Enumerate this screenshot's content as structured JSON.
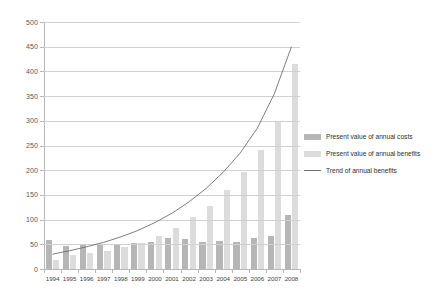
{
  "chart_data": {
    "type": "bar",
    "title": "",
    "subtitle": "",
    "xlabel": "",
    "ylabel": "",
    "ylim": [
      0,
      500
    ],
    "ytick_step": 50,
    "ytick_labels": [
      "500",
      "450",
      "400",
      "350",
      "300",
      "250",
      "200",
      "150",
      "100",
      "50",
      "0"
    ],
    "ytick_values": [
      500,
      450,
      400,
      350,
      300,
      250,
      200,
      150,
      100,
      50,
      0
    ],
    "grid": true,
    "legend_position": "right",
    "categories": [
      "1994",
      "1995",
      "1996",
      "1997",
      "1998",
      "1999",
      "2000",
      "2001",
      "2002",
      "2003",
      "2004",
      "2005",
      "2006",
      "2007",
      "2008"
    ],
    "series": [
      {
        "name": "Present value of annual costs",
        "kind": "bar",
        "color": "#b6b6b6",
        "values": [
          58,
          46,
          48,
          50,
          50,
          52,
          55,
          62,
          60,
          55,
          56,
          55,
          62,
          67,
          110
        ]
      },
      {
        "name": "Present value of annual benefits",
        "kind": "bar",
        "color": "#dcdcdc",
        "values": [
          18,
          28,
          32,
          36,
          44,
          52,
          66,
          84,
          105,
          128,
          160,
          196,
          240,
          300,
          415
        ]
      },
      {
        "name": "Trend of annual benefits",
        "kind": "line",
        "color": "#6f6f6f",
        "values": [
          30,
          37,
          45,
          54,
          65,
          78,
          94,
          113,
          136,
          163,
          196,
          235,
          285,
          355,
          450
        ]
      }
    ],
    "legend": [
      {
        "label": "Present value of annual costs",
        "swatch": "costs"
      },
      {
        "label": "Present value of annual benefits",
        "swatch": "benefits"
      },
      {
        "label": "Trend of annual benefits",
        "swatch": "line"
      }
    ]
  }
}
